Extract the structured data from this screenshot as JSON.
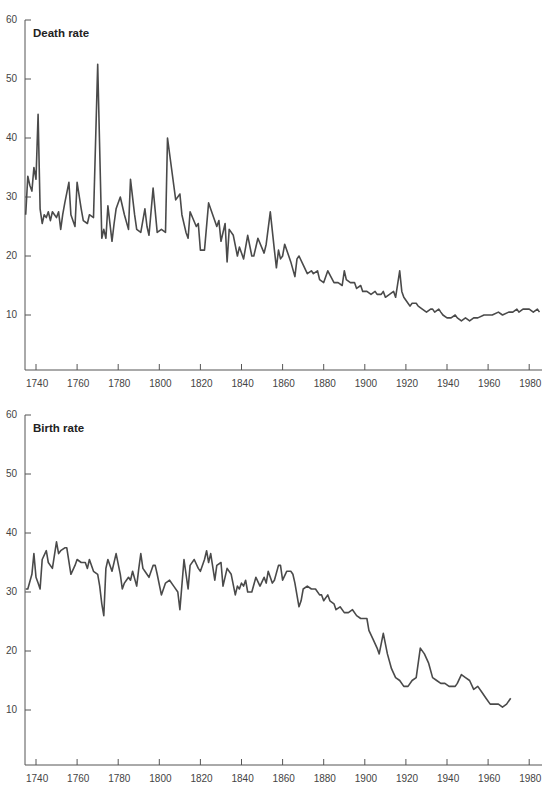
{
  "chart_data": [
    {
      "type": "line",
      "title": "Death rate",
      "xlabel": "",
      "ylabel": "",
      "xlim": [
        1735,
        1988
      ],
      "ylim": [
        0,
        60
      ],
      "grid": false,
      "legend": null,
      "x_ticks": [
        1740,
        1760,
        1780,
        1800,
        1820,
        1840,
        1860,
        1880,
        1900,
        1920,
        1940,
        1960,
        1980
      ],
      "y_ticks": [
        10,
        20,
        30,
        40,
        50,
        60
      ],
      "series": [
        {
          "name": "Death rate",
          "x": [
            1735,
            1736,
            1737,
            1738,
            1739,
            1740,
            1741,
            1742,
            1743,
            1744,
            1745,
            1746,
            1747,
            1748,
            1749,
            1750,
            1751,
            1752,
            1753,
            1754,
            1756,
            1757,
            1759,
            1760,
            1762,
            1763,
            1765,
            1766,
            1768,
            1770,
            1772,
            1773,
            1774,
            1775,
            1777,
            1778,
            1779,
            1781,
            1783,
            1785,
            1786,
            1788,
            1789,
            1791,
            1793,
            1794,
            1795,
            1797,
            1799,
            1801,
            1803,
            1804,
            1808,
            1810,
            1811,
            1813,
            1814,
            1815,
            1818,
            1819,
            1820,
            1822,
            1824,
            1828,
            1829,
            1830,
            1832,
            1833,
            1834,
            1836,
            1838,
            1839,
            1841,
            1843,
            1845,
            1846,
            1848,
            1851,
            1852,
            1854,
            1856,
            1857,
            1858,
            1859,
            1860,
            1861,
            1864,
            1866,
            1867,
            1868,
            1870,
            1872,
            1874,
            1875,
            1877,
            1878,
            1880,
            1882,
            1885,
            1887,
            1889,
            1890,
            1891,
            1893,
            1895,
            1896,
            1898,
            1899,
            1901,
            1903,
            1905,
            1906,
            1908,
            1909,
            1910,
            1912,
            1914,
            1915,
            1917,
            1918,
            1919,
            1920,
            1921,
            1922,
            1923,
            1925,
            1926,
            1928,
            1930,
            1932,
            1933,
            1934,
            1936,
            1937,
            1938,
            1940,
            1942,
            1944,
            1945,
            1947,
            1949,
            1951,
            1953,
            1955,
            1958,
            1960,
            1962,
            1965,
            1967,
            1970,
            1972,
            1974,
            1975,
            1977,
            1980,
            1982,
            1984,
            1985
          ],
          "values": [
            27,
            33.5,
            32,
            31,
            35,
            33,
            44,
            28,
            25.5,
            27,
            26.5,
            27.5,
            26,
            27.5,
            27,
            26.5,
            27.5,
            24.5,
            27,
            29,
            32.5,
            27,
            25,
            32.5,
            28,
            26,
            25.5,
            27,
            26.5,
            52.5,
            23,
            24.5,
            23,
            28.5,
            22.5,
            25.5,
            28,
            30,
            27,
            24.5,
            33,
            27,
            24.5,
            24,
            28,
            25,
            23.5,
            31.5,
            24,
            24.5,
            24,
            40,
            29.5,
            30.5,
            27,
            24,
            23,
            27.5,
            25,
            25.5,
            21,
            21,
            29,
            25,
            26,
            22.5,
            25.5,
            19,
            24.5,
            23.5,
            20,
            21.5,
            19.5,
            23.5,
            20,
            20,
            23,
            20.5,
            22,
            27.5,
            21,
            18,
            21,
            19.5,
            20,
            22,
            19,
            16.5,
            19.5,
            20,
            18.5,
            17,
            17.5,
            17,
            17.5,
            16,
            15.5,
            17.5,
            15.5,
            15.5,
            15,
            17.5,
            16,
            15.5,
            15.5,
            14.5,
            15,
            14,
            14,
            13.5,
            14,
            13.5,
            13.5,
            14,
            13,
            13.5,
            14,
            13,
            17.5,
            14,
            13,
            12.5,
            12,
            11.5,
            12,
            12,
            11.5,
            11,
            10.5,
            11,
            11,
            10.5,
            11,
            10.5,
            10,
            9.5,
            9.5,
            10,
            9.5,
            9,
            9.5,
            9,
            9.5,
            9.5,
            10,
            10,
            10,
            10.5,
            10,
            10.5,
            10.5,
            11,
            10.5,
            11,
            11,
            10.5,
            11,
            10.5
          ]
        }
      ]
    },
    {
      "type": "line",
      "title": "Birth rate",
      "xlabel": "",
      "ylabel": "",
      "xlim": [
        1735,
        1988
      ],
      "ylim": [
        0,
        60
      ],
      "grid": false,
      "legend": null,
      "x_ticks": [
        1740,
        1760,
        1780,
        1800,
        1820,
        1840,
        1860,
        1880,
        1900,
        1920,
        1940,
        1960,
        1980
      ],
      "y_ticks": [
        10,
        20,
        30,
        40,
        50,
        60
      ],
      "series": [
        {
          "name": "Birth rate",
          "x": [
            1735,
            1736,
            1738,
            1739,
            1740,
            1741,
            1742,
            1743,
            1745,
            1746,
            1748,
            1750,
            1751,
            1752,
            1754,
            1755,
            1757,
            1759,
            1760,
            1762,
            1764,
            1765,
            1766,
            1768,
            1770,
            1771,
            1772,
            1773,
            1774,
            1775,
            1777,
            1779,
            1781,
            1782,
            1783,
            1784,
            1785,
            1786,
            1787,
            1789,
            1790,
            1791,
            1792,
            1793,
            1795,
            1797,
            1798,
            1799,
            1801,
            1803,
            1805,
            1807,
            1809,
            1810,
            1812,
            1814,
            1815,
            1817,
            1819,
            1820,
            1822,
            1823,
            1824,
            1825,
            1827,
            1828,
            1830,
            1831,
            1833,
            1835,
            1837,
            1838,
            1839,
            1840,
            1841,
            1842,
            1843,
            1845,
            1847,
            1849,
            1851,
            1852,
            1853,
            1855,
            1856,
            1858,
            1859,
            1860,
            1862,
            1864,
            1865,
            1866,
            1868,
            1869,
            1870,
            1872,
            1874,
            1876,
            1878,
            1879,
            1880,
            1882,
            1883,
            1885,
            1886,
            1888,
            1890,
            1892,
            1894,
            1896,
            1898,
            1900,
            1901,
            1902,
            1904,
            1906,
            1907,
            1909,
            1911,
            1913,
            1915,
            1917,
            1919,
            1921,
            1923,
            1925,
            1927,
            1929,
            1931,
            1933,
            1935,
            1937,
            1939,
            1941,
            1944,
            1945,
            1947,
            1949,
            1951,
            1953,
            1955,
            1957,
            1959,
            1961,
            1963,
            1965,
            1967,
            1969,
            1971,
            1973,
            1975,
            1977,
            1979,
            1981,
            1983,
            1985
          ],
          "values": [
            30.5,
            30.5,
            33,
            36.5,
            32.5,
            31.5,
            30.5,
            35.5,
            37,
            35,
            34,
            38.5,
            36.5,
            37,
            37.5,
            37.5,
            33,
            34.5,
            35.5,
            35,
            35,
            34,
            35.5,
            33.5,
            33,
            31,
            28,
            26,
            34,
            35.5,
            33.5,
            36.5,
            33,
            30.5,
            31.5,
            32,
            32.5,
            32,
            33.5,
            31,
            34,
            36.5,
            34,
            33.5,
            32.5,
            34.5,
            34.5,
            33,
            29.5,
            31.5,
            32,
            31,
            30,
            27,
            35.5,
            30.5,
            34.5,
            35.5,
            34,
            33.5,
            35.5,
            37,
            35,
            36.5,
            32,
            34.5,
            35,
            31,
            34,
            33,
            29.5,
            31,
            30.5,
            31.5,
            31,
            32,
            30,
            30,
            32.5,
            31,
            32.5,
            31.5,
            33.5,
            31.5,
            32,
            34.5,
            34.5,
            32,
            33.5,
            33.5,
            33,
            31.5,
            27.5,
            28.5,
            30.5,
            31,
            30.5,
            30.5,
            29.5,
            29.5,
            28.5,
            29.5,
            28.5,
            28,
            27,
            27.5,
            26.5,
            26.5,
            27,
            26,
            25.5,
            25.5,
            25.5,
            23.5,
            22,
            20.5,
            19.5,
            23,
            19.5,
            17,
            15.5,
            15,
            14,
            14,
            15,
            15.5,
            20.5,
            19.5,
            18,
            15.5,
            15,
            14.5,
            14.5,
            14,
            14,
            14.5,
            16,
            15.5,
            15,
            13.5,
            14,
            13,
            12,
            11,
            11,
            11,
            10.5,
            11,
            12
          ]
        }
      ]
    }
  ],
  "charts": {
    "death": {
      "title": "Death rate"
    },
    "birth": {
      "title": "Birth rate"
    }
  }
}
